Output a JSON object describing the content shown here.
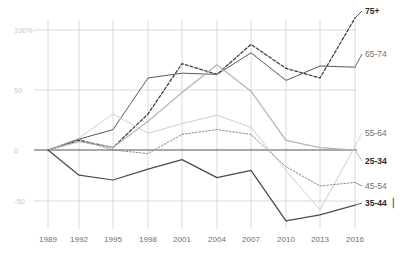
{
  "chart_data": {
    "type": "line",
    "title": "",
    "subtitle": "",
    "xlabel": "",
    "ylabel": "",
    "x": [
      1989,
      1992,
      1995,
      1998,
      2001,
      2004,
      2007,
      2010,
      2013,
      2016
    ],
    "x_tick_labels": [
      "1989",
      "1992",
      "1995",
      "1998",
      "2001",
      "2004",
      "2007",
      "2010",
      "2013",
      "2016"
    ],
    "y_tick_labels": [
      "100%",
      "50",
      "0",
      "-50"
    ],
    "y_tick_values": [
      100,
      50,
      0,
      -50
    ],
    "ylim": [
      -75,
      120
    ],
    "xlim": [
      1989,
      2016
    ],
    "grid": true,
    "zero_line": true,
    "legend_position": "right-inline",
    "series": [
      {
        "name": "75+",
        "label": "75+",
        "color": "#3b3b3b",
        "style": "dashed",
        "weight": "bold",
        "label_y": 14,
        "values": [
          0,
          8,
          2,
          30,
          72,
          63,
          88,
          68,
          60,
          110
        ]
      },
      {
        "name": "65-74",
        "label": "65-74",
        "color": "#5a5a5a",
        "style": "solid",
        "weight": "normal",
        "label_y": 57,
        "values": [
          0,
          9,
          17,
          60,
          64,
          63,
          81,
          58,
          70,
          69
        ]
      },
      {
        "name": "55-64",
        "label": "55-64",
        "color": "#cfcfcf",
        "style": "solid",
        "weight": "normal",
        "label_y": 136,
        "values": [
          0,
          10,
          30,
          14,
          22,
          29,
          19,
          -17,
          -50,
          3
        ]
      },
      {
        "name": "25-34",
        "label": "25-34",
        "color": "#b5b5b5",
        "style": "solid",
        "weight": "bold",
        "label_y": 164,
        "values": [
          0,
          7,
          2,
          24,
          48,
          71,
          49,
          8,
          2,
          0
        ]
      },
      {
        "name": "45-54",
        "label": "45-54",
        "color": "#8a8a8a",
        "style": "dotted",
        "weight": "normal",
        "label_y": 189,
        "values": [
          0,
          9,
          0,
          -3,
          13,
          17,
          13,
          -14,
          -30,
          -27
        ]
      },
      {
        "name": "35-44",
        "label": "35-44",
        "color": "#4a4a4a",
        "style": "solid",
        "weight": "bold",
        "label_y": 206,
        "values": [
          0,
          -21,
          -25,
          -16,
          -8,
          -23,
          -17,
          -59,
          -54,
          -46
        ]
      }
    ]
  },
  "axes": {
    "y_labels": [
      {
        "text": "100%",
        "y": 30
      },
      {
        "text": "50",
        "y": 90
      },
      {
        "text": "0",
        "y": 150
      },
      {
        "text": "-50",
        "y": 201
      }
    ],
    "x_labels": [
      {
        "text": "1989",
        "x": 48
      },
      {
        "text": "1992",
        "x": 79
      },
      {
        "text": "1995",
        "x": 113
      },
      {
        "text": "1998",
        "x": 148
      },
      {
        "text": "2001",
        "x": 182
      },
      {
        "text": "2004",
        "x": 217
      },
      {
        "text": "2007",
        "x": 251
      },
      {
        "text": "2010",
        "x": 286
      },
      {
        "text": "2013",
        "x": 320
      },
      {
        "text": "2016",
        "x": 355
      }
    ]
  },
  "colors": {
    "grid": "#d0d0d0",
    "zero_line": "#555555",
    "tick_text": "#6e6e6e",
    "ytick_text": "#c9c9c9",
    "background": "#ffffff"
  },
  "cursor": {
    "visible": true,
    "glyph": "▏"
  }
}
